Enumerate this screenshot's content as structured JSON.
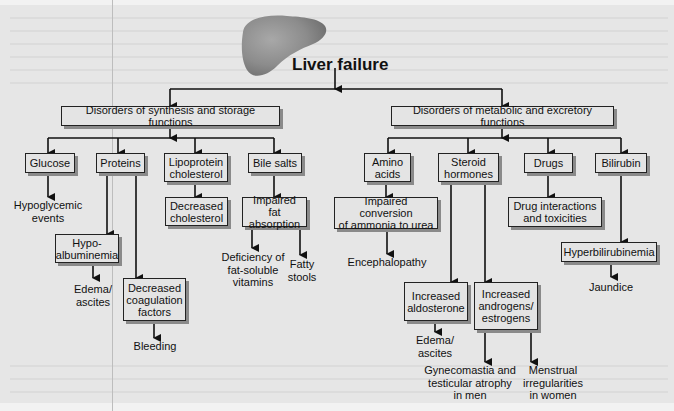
{
  "diagram": {
    "title": "Liver failure",
    "image": "liver-illustration",
    "branches": [
      {
        "label": "Disorders of synthesis and storage functions",
        "children": [
          {
            "label": "Glucose",
            "effects": [
              "Hypoglycemic events"
            ]
          },
          {
            "label": "Proteins",
            "children": [
              {
                "label": "Hypo-albuminemia",
                "effects": [
                  "Edema/ascites"
                ]
              },
              {
                "label": "Decreased coagulation factors",
                "effects": [
                  "Bleeding"
                ]
              }
            ]
          },
          {
            "label": "Lipoprotein cholesterol",
            "children": [
              {
                "label": "Decreased cholesterol"
              }
            ]
          },
          {
            "label": "Bile salts",
            "children": [
              {
                "label": "Impaired fat absorption",
                "effects": [
                  "Deficiency of fat-soluble vitamins",
                  "Fatty stools"
                ]
              }
            ]
          }
        ]
      },
      {
        "label": "Disorders of metabolic and excretory functions",
        "children": [
          {
            "label": "Amino acids",
            "children": [
              {
                "label": "Impaired conversion of ammonia to urea",
                "effects": [
                  "Encephalopathy"
                ]
              }
            ]
          },
          {
            "label": "Steroid hormones",
            "children": [
              {
                "label": "Increased aldosterone",
                "effects": [
                  "Edema/ascites"
                ]
              },
              {
                "label": "Increased androgens/estrogens",
                "effects": [
                  "Gynecomastia and testicular atrophy in men",
                  "Menstrual irregularities in women"
                ]
              }
            ]
          },
          {
            "label": "Drugs",
            "children": [
              {
                "label": "Drug interactions and toxicities"
              }
            ]
          },
          {
            "label": "Bilirubin",
            "children": [
              {
                "label": "Hyperbilirubinemia",
                "effects": [
                  "Jaundice"
                ]
              }
            ]
          }
        ]
      }
    ]
  },
  "text": {
    "title": "Liver failure",
    "synth": "Disorders of synthesis and storage functions",
    "metab": "Disorders of metabolic and excretory functions",
    "glucose": "Glucose",
    "hypoglycemic": "Hypoglycemic\nevents",
    "proteins": "Proteins",
    "hypoalbuminemia": "Hypo-\nalbuminemia",
    "edema1": "Edema/\nascites",
    "coag": "Decreased\ncoagulation\nfactors",
    "bleeding": "Bleeding",
    "lipo": "Lipoprotein\ncholesterol",
    "dec_chol": "Decreased\ncholesterol",
    "bile": "Bile salts",
    "fat_abs": "Impaired fat\nabsorption",
    "vitamins": "Deficiency of\nfat-soluble\nvitamins",
    "fatty": "Fatty\nstools",
    "amino": "Amino\nacids",
    "ammonia": "Impaired conversion\nof ammonia to urea",
    "enceph": "Encephalopathy",
    "steroid": "Steroid\nhormones",
    "aldo": "Increased\naldosterone",
    "edema2": "Edema/\nascites",
    "andro": "Increased\nandrogens/\nestrogens",
    "gyneco": "Gynecomastia and\ntesticular atrophy\nin men",
    "menstrual": "Menstrual\nirregularities\nin women",
    "drugs": "Drugs",
    "drug_int": "Drug interactions\nand toxicities",
    "bilirubin": "Bilirubin",
    "hyperbili": "Hyperbilirubinemia",
    "jaundice": "Jaundice"
  },
  "colors": {
    "background": "#e6e6e6",
    "box_fill": "#e4e4e4",
    "line": "#111111",
    "shadow": "#8a8a8a",
    "liver": "#8c8c8c"
  }
}
